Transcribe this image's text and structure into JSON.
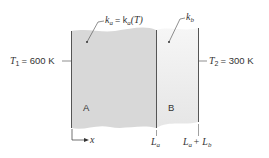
{
  "diagram": {
    "type": "composite-wall-conduction",
    "left_boundary": {
      "label_var": "T",
      "label_sub": "1",
      "label_value": "= 600 K"
    },
    "right_boundary": {
      "label_var": "T",
      "label_sub": "2",
      "label_value": "= 300 K"
    },
    "material_a": {
      "name": "A",
      "conductivity": "k",
      "conductivity_sub": "a",
      "relation": "= k",
      "relation_sub": "a",
      "relation_arg": "(T)"
    },
    "material_b": {
      "name": "B",
      "conductivity": "k",
      "conductivity_sub": "b"
    },
    "axis": {
      "label": "x"
    },
    "positions": {
      "interface": {
        "var": "L",
        "sub": "a"
      },
      "end": {
        "var": "L",
        "sub": "a",
        "plus": "+ L",
        "sub2": "b"
      }
    },
    "colors": {
      "material_a": "#d8d8d8",
      "material_b": "#ededed",
      "lines": "#555555"
    }
  }
}
